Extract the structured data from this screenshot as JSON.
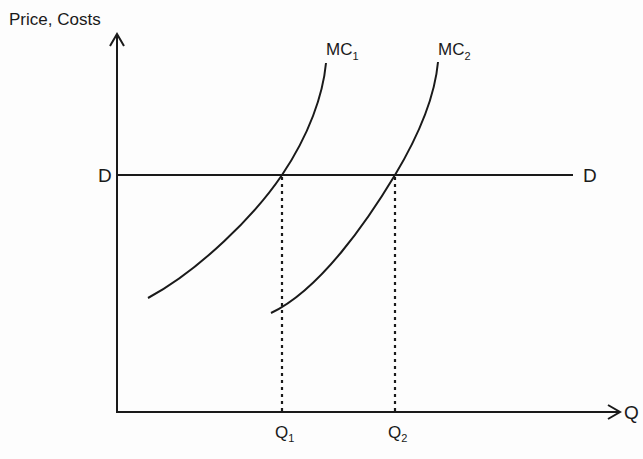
{
  "diagram": {
    "title": "",
    "y_axis_label": "Price, Costs",
    "x_axis_label": "Q",
    "price_line": {
      "label_left": "D",
      "label_right": "D"
    },
    "curves": [
      {
        "name": "MC",
        "subscript": "1"
      },
      {
        "name": "MC",
        "subscript": "2"
      }
    ],
    "quantities": [
      {
        "name": "Q",
        "subscript": "1"
      },
      {
        "name": "Q",
        "subscript": "2"
      }
    ],
    "colors": {
      "ink": "#1a1a1a",
      "background": "#fdfdfd"
    }
  }
}
